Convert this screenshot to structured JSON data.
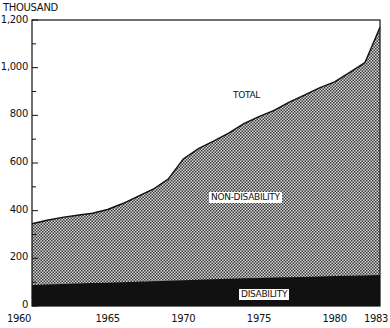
{
  "chart_data": {
    "type": "area",
    "stacked": true,
    "title": "",
    "xlabel": "",
    "ylabel": "THOUSAND",
    "x": [
      1960,
      1961,
      1962,
      1963,
      1964,
      1965,
      1966,
      1967,
      1968,
      1969,
      1970,
      1971,
      1972,
      1973,
      1974,
      1975,
      1976,
      1977,
      1978,
      1979,
      1980,
      1981,
      1982,
      1983
    ],
    "series": [
      {
        "name": "DISABILITY",
        "color": "#111111",
        "values": [
          88,
          90,
          92,
          94,
          96,
          98,
          100,
          102,
          104,
          106,
          108,
          110,
          112,
          114,
          116,
          118,
          120,
          121,
          122,
          124,
          126,
          127,
          128,
          130
        ]
      },
      {
        "name": "NON-DISABILITY",
        "color": "#9a9a9a",
        "pattern": "stipple",
        "values": [
          257,
          270,
          280,
          287,
          293,
          307,
          330,
          358,
          386,
          426,
          509,
          550,
          580,
          611,
          649,
          677,
          701,
          734,
          763,
          791,
          814,
          853,
          893,
          1040
        ]
      }
    ],
    "total": {
      "name": "TOTAL",
      "values": [
        345,
        360,
        372,
        381,
        389,
        405,
        430,
        460,
        490,
        532,
        617,
        660,
        692,
        725,
        765,
        795,
        821,
        855,
        885,
        915,
        940,
        980,
        1021,
        1170
      ]
    },
    "yticks": [
      "0",
      "200",
      "400",
      "600",
      "800",
      "1,000",
      "1,200"
    ],
    "xticks": [
      "1960",
      "1965",
      "1970",
      "1975",
      "1980",
      "1983"
    ],
    "ylim": [
      0,
      1200
    ],
    "xlim": [
      1960,
      1983
    ],
    "grid": false,
    "legend": "inline labels",
    "annotations": [
      "TOTAL",
      "NON-DISABILITY",
      "DISABILITY"
    ]
  },
  "labels": {
    "unit": "THOUSAND",
    "total": "TOTAL",
    "non_disability": "NON-DISABILITY",
    "disability": "DISABILITY"
  }
}
